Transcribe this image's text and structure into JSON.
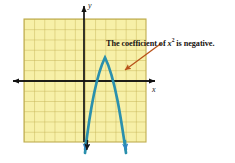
{
  "figure": {
    "kind": "coordinate-plane-graph",
    "grid": {
      "fill_color": "#f7f0a8",
      "line_color": "#b8a94a",
      "border_color": "#b8a94a",
      "columns": 12,
      "rows": 12,
      "cell_size_px": 10.2,
      "left_px": 24,
      "top_px": 19,
      "width_px": 122,
      "height_px": 123
    },
    "axes": {
      "color": "#111111",
      "x_axis_y_px": 81,
      "y_axis_x_px": 84,
      "x_label": "x",
      "y_label": "y",
      "x_arrow_left_px": 11,
      "x_arrow_right_px": 157,
      "y_arrow_top_px": 4
    },
    "curve": {
      "name": "downward-parabola",
      "color": "#2a90ad",
      "stroke_width_px": 2.6,
      "opens": "down",
      "vertex_px": [
        105,
        57
      ],
      "left_arm_end_px": [
        85,
        156
      ],
      "right_arm_end_px": [
        126,
        156
      ],
      "arrowheads": 2,
      "arrowhead_color": "#2f86c4",
      "extra_arrowhead_color": "#1a1a1a"
    },
    "annotation": {
      "text_prefix": "The coefficient of ",
      "text_variable": "x",
      "text_exponent": "2",
      "text_suffix": " is negative.",
      "full_text": "The coefficient of x2 is negative.",
      "leader_color": "#b8531a",
      "leader_from_px": [
        160,
        44
      ],
      "leader_to_px": [
        124,
        70
      ]
    }
  }
}
